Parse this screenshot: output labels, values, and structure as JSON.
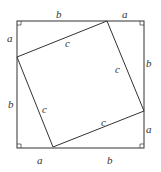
{
  "diagram": {
    "title": "",
    "outer_square": {
      "x1": 17,
      "y1": 21,
      "x2": 144,
      "y2": 148
    },
    "inner_square": [
      [
        107,
        21
      ],
      [
        144,
        111
      ],
      [
        53,
        147
      ],
      [
        17,
        57
      ]
    ],
    "colors": {
      "stroke": "#333333",
      "background": "#ffffff"
    },
    "labels": {
      "top_b": "b",
      "top_a": "a",
      "left_a": "a",
      "left_b": "b",
      "right_b": "b",
      "right_a": "a",
      "bottom_a": "a",
      "bottom_b": "b",
      "c_top": "c",
      "c_right": "c",
      "c_left": "c",
      "c_bottom": "c"
    }
  }
}
